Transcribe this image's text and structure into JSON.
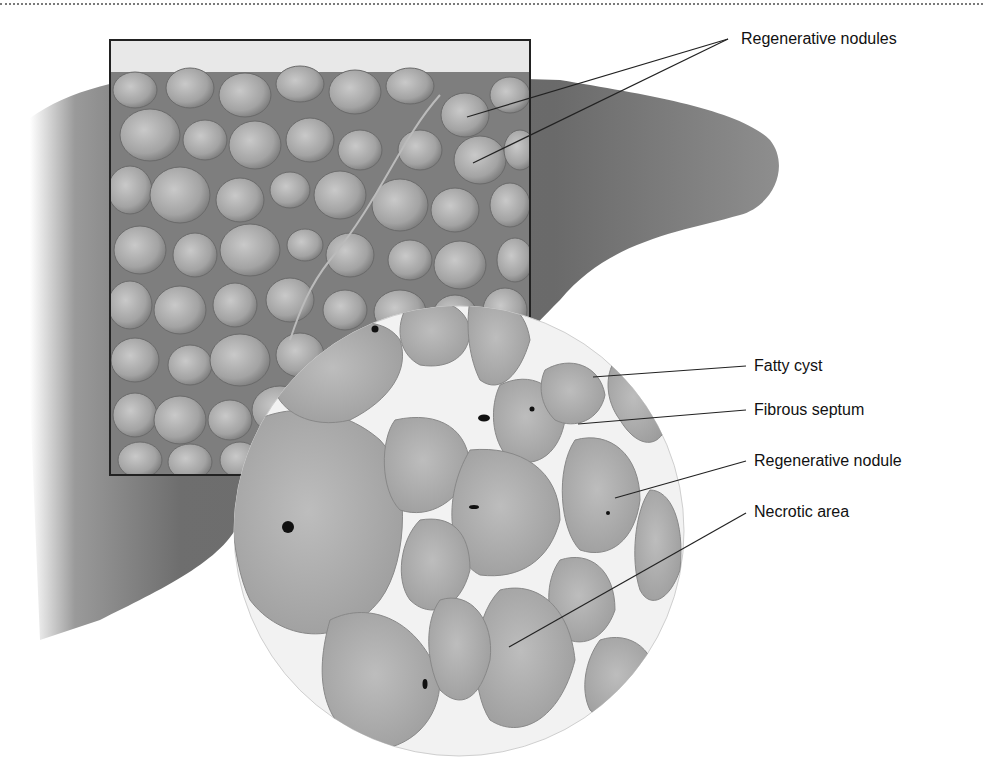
{
  "figure": {
    "colors": {
      "liver_dark": "#5a5a5a",
      "liver_mid": "#8c8c8c",
      "nodule_light": "#bdbdbd",
      "nodule_mid": "#9a9a9a",
      "septum": "#f2f2f2",
      "frame": "#222222",
      "leader": "#222222",
      "label_text": "#111111"
    }
  },
  "labels": {
    "regenerative_nodules": "Regenerative nodules",
    "fatty_cyst": "Fatty cyst",
    "fibrous_septum": "Fibrous septum",
    "regenerative_nodule": "Regenerative nodule",
    "necrotic_area": "Necrotic area"
  }
}
